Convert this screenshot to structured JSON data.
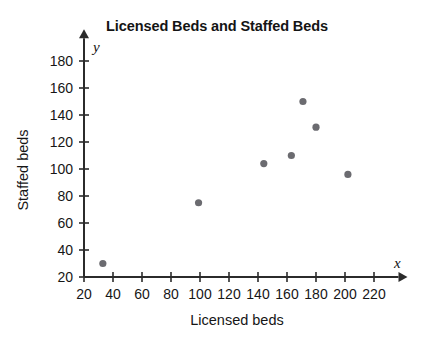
{
  "chart_data": {
    "type": "scatter",
    "title": "Licensed Beds and Staffed Beds",
    "xlabel": "Licensed beds",
    "ylabel": "Staffed beds",
    "x_axis_variable": "x",
    "y_axis_variable": "y",
    "xlim": [
      20,
      230
    ],
    "ylim": [
      20,
      188
    ],
    "xticks": [
      20,
      40,
      60,
      80,
      100,
      120,
      140,
      160,
      180,
      200,
      220
    ],
    "yticks": [
      20,
      40,
      60,
      80,
      100,
      120,
      140,
      160,
      180
    ],
    "xtick_labels": [
      "20",
      "40",
      "60",
      "80",
      "100",
      "120",
      "140",
      "160",
      "180",
      "200",
      "220"
    ],
    "ytick_labels": [
      "20",
      "40",
      "60",
      "80",
      "100",
      "120",
      "140",
      "160",
      "180"
    ],
    "grid": false,
    "legend": false,
    "point_color": "#6b6b70",
    "axis_color": "#2b2b2b",
    "points": [
      {
        "x": 33,
        "y": 30
      },
      {
        "x": 99,
        "y": 75
      },
      {
        "x": 144,
        "y": 104
      },
      {
        "x": 163,
        "y": 110
      },
      {
        "x": 171,
        "y": 150
      },
      {
        "x": 180,
        "y": 131
      },
      {
        "x": 202,
        "y": 96
      }
    ]
  }
}
